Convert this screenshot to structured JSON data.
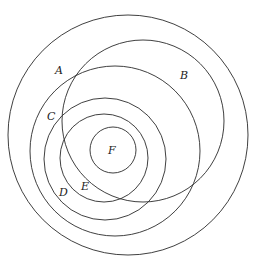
{
  "diagram": {
    "type": "nested-circles",
    "stroke_color": "#2a2a2a",
    "background": "#ffffff",
    "circles": [
      {
        "label": "A",
        "cx": 128,
        "cy": 135,
        "r": 120,
        "label_x": 55,
        "label_y": 74
      },
      {
        "label": "B",
        "cx": 143,
        "cy": 121,
        "r": 81,
        "label_x": 180,
        "label_y": 79
      },
      {
        "label": "C",
        "cx": 115,
        "cy": 151,
        "r": 85,
        "label_x": 47,
        "label_y": 120
      },
      {
        "label": "D",
        "cx": 105,
        "cy": 159,
        "r": 61,
        "label_x": 59,
        "label_y": 196
      },
      {
        "label": "E",
        "cx": 104,
        "cy": 158,
        "r": 44,
        "label_x": 81,
        "label_y": 190
      },
      {
        "label": "F",
        "cx": 113,
        "cy": 150,
        "r": 23,
        "label_x": 108,
        "label_y": 154
      }
    ]
  }
}
